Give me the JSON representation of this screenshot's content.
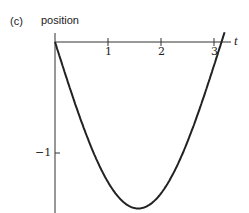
{
  "panel_label": "(c)",
  "chart_data": {
    "type": "line",
    "title": "",
    "xlabel": "t",
    "ylabel": "position",
    "x_ticks": [
      "1",
      "2",
      "3"
    ],
    "y_ticks": [
      "−1"
    ],
    "xlim": [
      0,
      3.3
    ],
    "ylim": [
      -1.55,
      0
    ],
    "grid": false,
    "legend": null,
    "series": [
      {
        "name": "position",
        "function": "-1.5*sin(t)",
        "x": [
          0,
          0.25,
          0.5,
          0.75,
          1.0,
          1.25,
          1.5,
          1.75,
          2.0,
          2.25,
          2.5,
          2.75,
          3.0,
          3.14,
          3.2
        ],
        "values": [
          0,
          -0.37,
          -0.72,
          -1.02,
          -1.26,
          -1.42,
          -1.5,
          -1.48,
          -1.36,
          -1.16,
          -0.9,
          -0.57,
          -0.21,
          0,
          0.09
        ]
      }
    ]
  }
}
